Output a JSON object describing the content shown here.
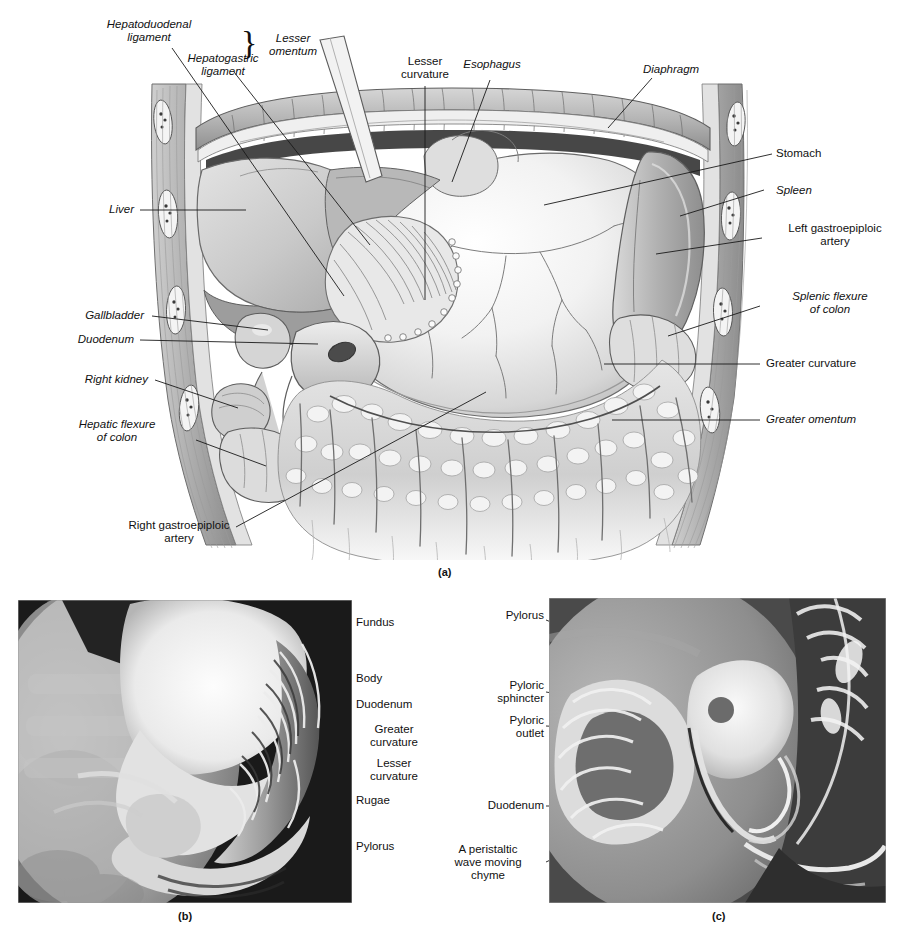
{
  "figure": {
    "panels": [
      {
        "id": "a",
        "caption": "(a)",
        "kind": "illustration"
      },
      {
        "id": "b",
        "caption": "(b)",
        "kind": "radiograph"
      },
      {
        "id": "c",
        "caption": "(c)",
        "kind": "radiograph"
      }
    ]
  },
  "panel_a": {
    "caption": "(a)",
    "brace_label": "Lesser\nomentum",
    "labels": [
      {
        "id": "hepatoduodenal-ligament",
        "text": "Hepatoduodenal\nligament",
        "italic": true,
        "align": "center"
      },
      {
        "id": "hepatogastric-ligament",
        "text": "Hepatogastric\nligament",
        "italic": true,
        "align": "center"
      },
      {
        "id": "lesser-omentum",
        "text": "Lesser\nomentum",
        "italic": true,
        "align": "center"
      },
      {
        "id": "lesser-curvature",
        "text": "Lesser\ncurvature",
        "italic": false,
        "align": "center"
      },
      {
        "id": "esophagus",
        "text": "Esophagus",
        "italic": true,
        "align": "center"
      },
      {
        "id": "diaphragm",
        "text": "Diaphragm",
        "italic": true,
        "align": "center"
      },
      {
        "id": "stomach",
        "text": "Stomach",
        "italic": false,
        "align": "left"
      },
      {
        "id": "spleen",
        "text": "Spleen",
        "italic": true,
        "align": "left"
      },
      {
        "id": "left-gastroepiploic-artery",
        "text": "Left gastroepiploic\nartery",
        "italic": false,
        "align": "center"
      },
      {
        "id": "splenic-flexure-of-colon",
        "text": "Splenic flexure\nof colon",
        "italic": true,
        "align": "center"
      },
      {
        "id": "greater-curvature",
        "text": "Greater curvature",
        "italic": false,
        "align": "left"
      },
      {
        "id": "greater-omentum",
        "text": "Greater omentum",
        "italic": true,
        "align": "left"
      },
      {
        "id": "liver",
        "text": "Liver",
        "italic": true,
        "align": "right"
      },
      {
        "id": "gallbladder",
        "text": "Gallbladder",
        "italic": true,
        "align": "right"
      },
      {
        "id": "duodenum",
        "text": "Duodenum",
        "italic": true,
        "align": "right"
      },
      {
        "id": "right-kidney",
        "text": "Right kidney",
        "italic": true,
        "align": "right"
      },
      {
        "id": "hepatic-flexure-of-colon",
        "text": "Hepatic flexure\nof colon",
        "italic": true,
        "align": "center"
      },
      {
        "id": "right-gastroepiploic-artery",
        "text": "Right gastroepiploic\nartery",
        "italic": false,
        "align": "center"
      }
    ]
  },
  "panel_b": {
    "caption": "(b)",
    "labels": [
      {
        "id": "fundus",
        "text": "Fundus"
      },
      {
        "id": "body",
        "text": "Body"
      },
      {
        "id": "duodenum",
        "text": "Duodenum"
      },
      {
        "id": "greater-curvature",
        "text": "Greater\ncurvature"
      },
      {
        "id": "lesser-curvature",
        "text": "Lesser\ncurvature"
      },
      {
        "id": "rugae",
        "text": "Rugae"
      },
      {
        "id": "pylorus",
        "text": "Pylorus"
      }
    ]
  },
  "panel_c": {
    "caption": "(c)",
    "labels": [
      {
        "id": "pylorus",
        "text": "Pylorus"
      },
      {
        "id": "pyloric-sphincter",
        "text": "Pyloric\nsphincter"
      },
      {
        "id": "pyloric-outlet",
        "text": "Pyloric\noutlet"
      },
      {
        "id": "duodenum",
        "text": "Duodenum"
      },
      {
        "id": "peristaltic-wave",
        "text": "A peristaltic\nwave moving\nchyme"
      }
    ]
  },
  "colors": {
    "text": "#111111",
    "leader": "#1a1a1a",
    "page_background": "#ffffff",
    "radiograph_dark": "#161616",
    "radiograph_light": "#e9e9e9",
    "illustration_mid": "#b9b9b9"
  }
}
